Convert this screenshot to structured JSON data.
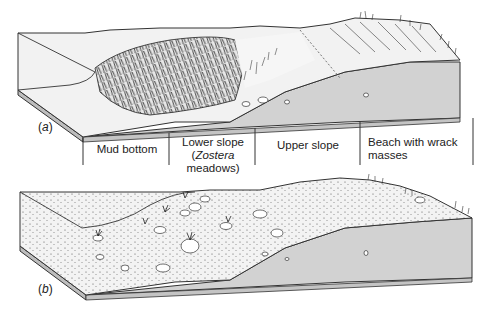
{
  "figure": {
    "panel_a": {
      "label_prefix": "(",
      "label_letter": "a",
      "label_suffix": ")",
      "zones": [
        {
          "id": "mud-bottom",
          "line1": "Mud bottom",
          "line2": ""
        },
        {
          "id": "lower-slope",
          "line1": "Lower slope",
          "line2_italic": "Zostera",
          "line2_rest": " meadows)",
          "line2_open": "("
        },
        {
          "id": "upper-slope",
          "line1": "Upper slope",
          "line2": ""
        },
        {
          "id": "beach",
          "line1": "Beach with wrack",
          "line2": "masses"
        }
      ]
    },
    "panel_b": {
      "label_prefix": "(",
      "label_letter": "b",
      "label_suffix": ")"
    },
    "colors": {
      "surface": "#f2f2f2",
      "side_face": "#d4d4d4",
      "outline": "#333333",
      "vegetation": "#2a2a2a"
    }
  }
}
